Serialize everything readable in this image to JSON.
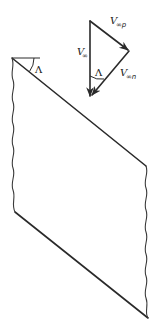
{
  "figure": {
    "type": "swept-wing velocity decomposition",
    "wing": {
      "sweep_angle_label": "Λ",
      "edges": [
        "leading-edge",
        "trailing-edge",
        "root-break",
        "tip-break"
      ]
    },
    "vector_triangle": {
      "freestream": {
        "symbol": "V",
        "subscript": "∞",
        "full": "V∞"
      },
      "parallel_component": {
        "symbol": "V",
        "subscript": "∞p",
        "full": "V∞p"
      },
      "normal_component": {
        "symbol": "V",
        "subscript": "∞n",
        "full": "V∞n"
      },
      "angle_label": "Λ"
    }
  },
  "labels": {
    "wing_angle": "Λ",
    "v_inf_main": "V",
    "v_inf_sub": "∞",
    "v_p_main": "V",
    "v_p_sub": "∞p",
    "v_n_main": "V",
    "v_n_sub": "∞n",
    "triangle_angle": "Λ"
  },
  "colors": {
    "line": "#2a2a2a",
    "background": "#ffffff"
  }
}
